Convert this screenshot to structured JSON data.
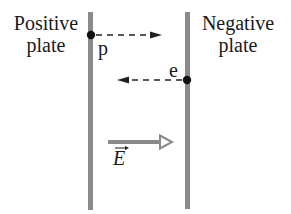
{
  "plates": {
    "positive": {
      "label_line1": "Positive",
      "label_line2": "plate"
    },
    "negative": {
      "label_line1": "Negative",
      "label_line2": "plate"
    }
  },
  "particles": {
    "proton": {
      "label": "p",
      "direction": "right"
    },
    "electron": {
      "label": "e",
      "direction": "left"
    }
  },
  "field": {
    "label": "E",
    "vector_mark": "→",
    "direction": "right"
  },
  "colors": {
    "plate": "#8a8a8a",
    "field_arrow": "#8a8a8a",
    "particle": "#111111",
    "text": "#1a1a1a"
  }
}
